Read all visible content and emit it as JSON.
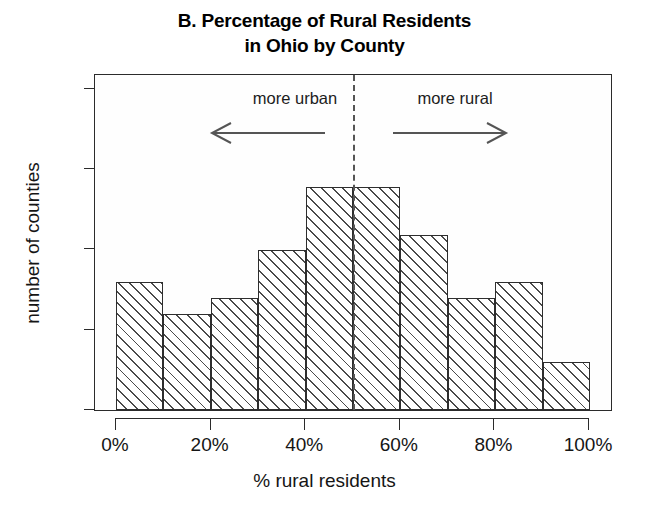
{
  "chart_data": {
    "type": "bar",
    "title": "B. Percentage of Rural Residents in Ohio by County",
    "title_lines": [
      "B. Percentage of Rural Residents",
      "in Ohio by County"
    ],
    "xlabel": "% rural residents",
    "ylabel": "number of counties",
    "grid": false,
    "legend": "none",
    "xlim": [
      0,
      100
    ],
    "ylim": [
      0,
      21
    ],
    "bin_width": 10,
    "categories": [
      "0-10%",
      "10-20%",
      "20-30%",
      "30-40%",
      "40-50%",
      "50-60%",
      "60-70%",
      "70-80%",
      "80-90%",
      "90-100%"
    ],
    "bin_edges": [
      0,
      10,
      20,
      30,
      40,
      50,
      60,
      70,
      80,
      90,
      100
    ],
    "values": [
      8,
      6,
      7,
      10,
      14,
      14,
      11,
      7,
      8,
      3
    ],
    "x_ticks": [
      0,
      20,
      40,
      60,
      80,
      100
    ],
    "x_tick_labels": [
      "0%",
      "20%",
      "40%",
      "60%",
      "80%",
      "100%"
    ],
    "y_ticks": [
      0,
      5,
      10,
      15,
      20
    ],
    "y_tick_labels": [
      "0",
      "5",
      "10",
      "15",
      "20"
    ],
    "annotations": [
      {
        "name": "more-urban",
        "text": "more urban",
        "x": 25,
        "arrow": "left"
      },
      {
        "name": "more-rural",
        "text": "more rural",
        "x": 75,
        "arrow": "right"
      }
    ],
    "reference_line": {
      "name": "midpoint-dashed-line",
      "x": 50,
      "style": "dashed"
    },
    "colors": {
      "bar_fill": "#ffffff",
      "bar_hatch": "#4a4a4a",
      "bar_border": "#2e2e2e",
      "axis": "#2b2b2b",
      "text": "#151515",
      "background": "#ffffff"
    }
  }
}
